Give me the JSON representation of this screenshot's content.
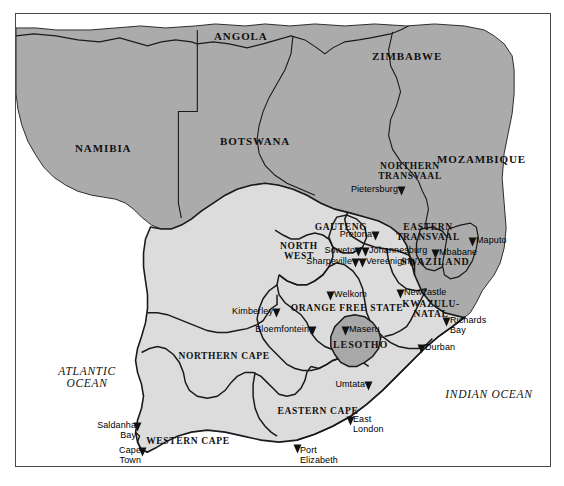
{
  "map": {
    "title": "Southern Africa political map",
    "frame": {
      "border_color": "#4a4a4a"
    },
    "colors": {
      "ocean": "#ffffff",
      "neighbor_fill": "#ababab",
      "south_africa_fill": "#dcdcdc",
      "enclave_fill": "#a8a8a8",
      "outline": "#1a1a1a",
      "text": "#111111"
    },
    "countries": [
      {
        "name": "ANGOLA",
        "x": 213,
        "y": 22
      },
      {
        "name": "ZIMBABWE",
        "x": 403,
        "y": 55
      },
      {
        "name": "NAMIBIA",
        "x": 99,
        "y": 146
      },
      {
        "name": "BOTSWANA",
        "x": 252,
        "y": 138
      },
      {
        "name": "MOZAMBIQUE",
        "x": 489,
        "y": 156
      },
      {
        "name": "SWAZILAND",
        "x": 440,
        "y": 260
      },
      {
        "name": "LESOTHO",
        "x": 352,
        "y": 338
      }
    ],
    "provinces": [
      {
        "name": "NORTHERN\nTRANSVAAL",
        "x": 394,
        "y": 165
      },
      {
        "name": "GAUTENG",
        "x": 325,
        "y": 224
      },
      {
        "name": "EASTERN\nTRANSVAAL",
        "x": 412,
        "y": 228
      },
      {
        "name": "NORTH\nWEST",
        "x": 283,
        "y": 247
      },
      {
        "name": "ORANGE FREE STATE",
        "x": 331,
        "y": 297
      },
      {
        "name": "KWAZULU-\nNATAL",
        "x": 415,
        "y": 304
      },
      {
        "name": "NORTHERN CAPE",
        "x": 208,
        "y": 345
      },
      {
        "name": "WESTERN CAPE",
        "x": 172,
        "y": 430
      },
      {
        "name": "EASTERN CAPE",
        "x": 302,
        "y": 400
      }
    ],
    "oceans": [
      {
        "name": "ATLANTIC\nOCEAN",
        "x": 71,
        "y": 371
      },
      {
        "name": "INDIAN OCEAN",
        "x": 473,
        "y": 381
      }
    ],
    "cities": [
      {
        "name": "Pietersburg",
        "x": 396,
        "y": 183,
        "side": "left"
      },
      {
        "name": "Maputo",
        "x": 467,
        "y": 234,
        "side": "right"
      },
      {
        "name": "Pretoria",
        "x": 370,
        "y": 227,
        "side": "left"
      },
      {
        "name": "Johannesburg",
        "x": 360,
        "y": 243,
        "side": "right"
      },
      {
        "name": "Soweto",
        "x": 353,
        "y": 243,
        "side": "left"
      },
      {
        "name": "Vereeniging",
        "x": 357,
        "y": 254,
        "side": "right"
      },
      {
        "name": "Sharpeville",
        "x": 350,
        "y": 254,
        "side": "left"
      },
      {
        "name": "Mbabane",
        "x": 430,
        "y": 245,
        "side": "right"
      },
      {
        "name": "Welkom",
        "x": 325,
        "y": 287,
        "side": "right"
      },
      {
        "name": "Newcastle",
        "x": 395,
        "y": 285,
        "side": "right"
      },
      {
        "name": "Kimberley",
        "x": 271,
        "y": 304,
        "side": "left"
      },
      {
        "name": "Richards Bay",
        "x": 441,
        "y": 313,
        "side": "right"
      },
      {
        "name": "Bloemfontein",
        "x": 307,
        "y": 322,
        "side": "left"
      },
      {
        "name": "Maseru",
        "x": 340,
        "y": 322,
        "side": "right"
      },
      {
        "name": "Durban",
        "x": 416,
        "y": 340,
        "side": "right"
      },
      {
        "name": "Umtata",
        "x": 363,
        "y": 377,
        "side": "left"
      },
      {
        "name": "East London",
        "x": 345,
        "y": 412,
        "side": "right"
      },
      {
        "name": "Saldanha Bay",
        "x": 132,
        "y": 418,
        "side": "left"
      },
      {
        "name": "Port Elizabeth",
        "x": 292,
        "y": 440,
        "side": "right"
      },
      {
        "name": "Cape Town",
        "x": 137,
        "y": 443,
        "side": "left"
      }
    ]
  }
}
